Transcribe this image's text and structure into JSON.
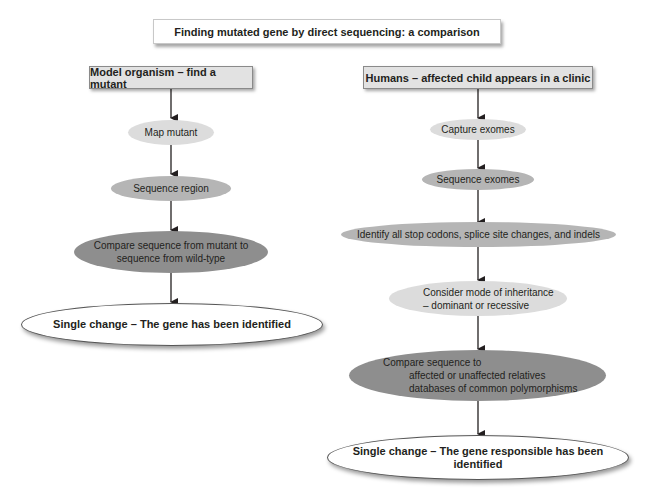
{
  "title": "Finding mutated gene by direct sequencing: a comparison",
  "left_column": {
    "header": "Model organism – find a mutant",
    "steps": [
      {
        "text": "Map mutant",
        "shade": "light"
      },
      {
        "text": "Sequence region",
        "shade": "mid"
      },
      {
        "line1": "Compare sequence from mutant to",
        "line2": "sequence from wild-type",
        "shade": "dark"
      }
    ],
    "result": "Single change – The gene has been identified"
  },
  "right_column": {
    "header": "Humans – affected child appears in a clinic",
    "steps": [
      {
        "text": "Capture exomes",
        "shade": "light"
      },
      {
        "text": "Sequence exomes",
        "shade": "mid"
      },
      {
        "text": "Identify all stop codons, splice site changes, and indels",
        "shade": "mid"
      },
      {
        "line1": "Consider mode of inheritance",
        "line2": "– dominant or recessive",
        "shade": "light"
      },
      {
        "line1": "Compare sequence to",
        "line2": "affected or unaffected relatives",
        "line3": "databases of common polymorphisms",
        "shade": "dark"
      }
    ],
    "result": "Single change – The gene responsible has been identified"
  },
  "colors": {
    "light_fill": "#dcdcdc",
    "mid_fill": "#b5b5b5",
    "dark_fill": "#8e8e8e",
    "header_fill": "#e2e2e2",
    "arrow": "#231f20"
  }
}
